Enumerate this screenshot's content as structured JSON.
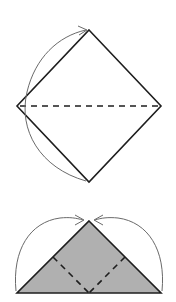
{
  "diagram": {
    "description": "Origami folding steps: a square diamond folded along the horizontal diagonal into a triangle, then the two base corners folded up to the apex.",
    "colors": {
      "stroke": "#1e1e1e",
      "arrow": "#6a6a6a",
      "fill": "#b0b0b0",
      "background": "#ffffff"
    },
    "steps": [
      {
        "id": "step-1",
        "shape": "diamond",
        "points": {
          "top": [
            89,
            30
          ],
          "left": [
            17,
            106
          ],
          "right": [
            161,
            106
          ],
          "bottom": [
            89,
            182
          ]
        },
        "fold_line": {
          "style": "valley-dashed",
          "from": [
            17,
            106
          ],
          "to": [
            161,
            106
          ]
        },
        "arrow": {
          "from": [
            86,
            181
          ],
          "to": [
            87,
            30
          ],
          "direction": "bottom-corner up to top-corner"
        }
      },
      {
        "id": "step-2",
        "shape": "triangle",
        "points": {
          "apex": [
            89,
            221
          ],
          "left": [
            17,
            293
          ],
          "right": [
            161,
            293
          ]
        },
        "fold_lines": [
          {
            "style": "valley-dashed",
            "from": [
              53,
              257
            ],
            "to": [
              89,
              293
            ]
          },
          {
            "style": "valley-dashed",
            "from": [
              125,
              257
            ],
            "to": [
              89,
              293
            ]
          }
        ],
        "arrows": [
          {
            "from": [
              16,
              291
            ],
            "to": [
              84,
              220
            ],
            "direction": "left corner up to apex"
          },
          {
            "from": [
              162,
              291
            ],
            "to": [
              94,
              220
            ],
            "direction": "right corner up to apex"
          }
        ]
      }
    ]
  }
}
